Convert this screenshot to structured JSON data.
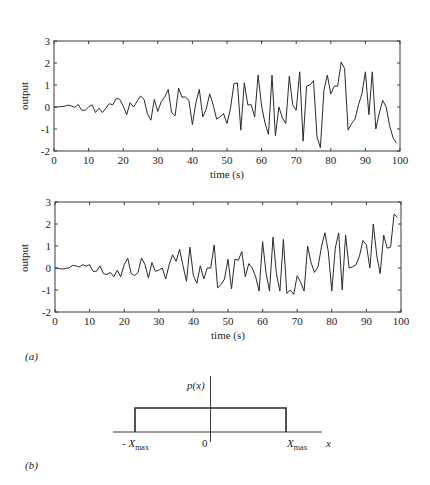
{
  "chart_data": [
    {
      "type": "line",
      "panel": "a-top",
      "title": "",
      "xlabel": "time (s)",
      "ylabel": "output",
      "xlim": [
        0,
        100
      ],
      "ylim": [
        -2,
        3
      ],
      "xticks": [
        0,
        10,
        20,
        30,
        40,
        50,
        60,
        70,
        80,
        90,
        100
      ],
      "yticks": [
        -2,
        -1,
        0,
        1,
        2,
        3
      ],
      "grid": false,
      "x": [
        0,
        1,
        2,
        3,
        4,
        5,
        6,
        7,
        8,
        9,
        10,
        11,
        12,
        13,
        14,
        15,
        16,
        17,
        18,
        19,
        20,
        21,
        22,
        23,
        24,
        25,
        26,
        27,
        28,
        29,
        30,
        31,
        32,
        33,
        34,
        35,
        36,
        37,
        38,
        39,
        40,
        41,
        42,
        43,
        44,
        45,
        46,
        47,
        48,
        49,
        50,
        51,
        52,
        53,
        54,
        55,
        56,
        57,
        58,
        59,
        60,
        61,
        62,
        63,
        64,
        65,
        66,
        67,
        68,
        69,
        70,
        71,
        72,
        73,
        74,
        75,
        76,
        77,
        78,
        79,
        80,
        81,
        82,
        83,
        84,
        85,
        86,
        87,
        88,
        89,
        90,
        91,
        92,
        93,
        94,
        95,
        96,
        97,
        98,
        99
      ],
      "values": [
        0.0,
        0.0,
        0.02,
        0.03,
        0.08,
        0.05,
        -0.02,
        0.12,
        -0.15,
        -0.15,
        0.0,
        0.1,
        -0.25,
        -0.05,
        -0.25,
        -0.05,
        0.15,
        0.1,
        0.4,
        0.35,
        0.05,
        -0.35,
        0.2,
        0.0,
        0.25,
        0.5,
        0.35,
        -0.3,
        -0.6,
        0.35,
        -0.2,
        0.25,
        0.45,
        0.8,
        -0.25,
        -0.4,
        0.85,
        0.45,
        0.45,
        0.3,
        -0.8,
        0.2,
        0.8,
        -0.45,
        -0.1,
        0.6,
        0.1,
        -0.55,
        -0.45,
        -0.3,
        -0.75,
        -0.05,
        1.05,
        1.1,
        -1.05,
        1.1,
        0.1,
        0.1,
        -0.45,
        1.45,
        0.05,
        -0.75,
        -1.25,
        1.45,
        -1.3,
        0.0,
        -0.5,
        -0.75,
        1.4,
        0.1,
        -0.15,
        1.6,
        -1.55,
        0.95,
        1.0,
        1.2,
        -1.35,
        -1.85,
        0.75,
        1.45,
        0.6,
        0.95,
        0.95,
        2.05,
        1.75,
        -1.05,
        -0.75,
        -0.55,
        0.1,
        0.6,
        1.6,
        -0.35,
        1.6,
        -1.0,
        -0.3,
        0.3,
        0.0,
        -0.85,
        -1.4,
        -1.65
      ]
    },
    {
      "type": "line",
      "panel": "a-bottom",
      "title": "",
      "xlabel": "time (s)",
      "ylabel": "output",
      "xlim": [
        0,
        100
      ],
      "ylim": [
        -2,
        3
      ],
      "xticks": [
        0,
        10,
        20,
        30,
        40,
        50,
        60,
        70,
        80,
        90,
        100
      ],
      "yticks": [
        -2,
        -1,
        0,
        1,
        2,
        3
      ],
      "grid": false,
      "x": [
        0,
        1,
        2,
        3,
        4,
        5,
        6,
        7,
        8,
        9,
        10,
        11,
        12,
        13,
        14,
        15,
        16,
        17,
        18,
        19,
        20,
        21,
        22,
        23,
        24,
        25,
        26,
        27,
        28,
        29,
        30,
        31,
        32,
        33,
        34,
        35,
        36,
        37,
        38,
        39,
        40,
        41,
        42,
        43,
        44,
        45,
        46,
        47,
        48,
        49,
        50,
        51,
        52,
        53,
        54,
        55,
        56,
        57,
        58,
        59,
        60,
        61,
        62,
        63,
        64,
        65,
        66,
        67,
        68,
        69,
        70,
        71,
        72,
        73,
        74,
        75,
        76,
        77,
        78,
        79,
        80,
        81,
        82,
        83,
        84,
        85,
        86,
        87,
        88,
        89,
        90,
        91,
        92,
        93,
        94,
        95,
        96,
        97,
        98,
        99
      ],
      "values": [
        0.0,
        -0.02,
        -0.05,
        -0.02,
        0.0,
        0.12,
        0.1,
        0.05,
        0.15,
        0.08,
        0.15,
        -0.15,
        -0.15,
        0.1,
        -0.25,
        -0.3,
        -0.2,
        -0.4,
        -0.1,
        -0.4,
        0.15,
        0.45,
        -0.25,
        -0.35,
        -0.2,
        0.45,
        0.15,
        -0.45,
        0.25,
        -0.15,
        -0.1,
        0.0,
        -0.5,
        0.15,
        0.6,
        0.3,
        0.85,
        0.1,
        -0.6,
        0.95,
        -0.35,
        -0.7,
        0.1,
        -0.5,
        0.0,
        0.0,
        1.05,
        -0.9,
        -0.75,
        -0.5,
        0.4,
        -0.95,
        0.4,
        0.35,
        0.75,
        -0.4,
        0.2,
        0.0,
        -0.4,
        -1.05,
        1.2,
        -0.25,
        -1.05,
        1.4,
        -0.25,
        -1.05,
        1.3,
        -1.15,
        -1.0,
        -1.2,
        -0.35,
        -0.65,
        -1.05,
        1.0,
        0.25,
        -0.2,
        0.05,
        0.95,
        1.6,
        0.75,
        -1.05,
        0.9,
        1.6,
        -1.0,
        1.5,
        0.0,
        0.05,
        0.15,
        0.55,
        1.25,
        1.05,
        0.0,
        2.0,
        0.55,
        -0.25,
        1.5,
        0.9,
        0.95,
        2.45,
        2.3,
        1.75
      ]
    },
    {
      "type": "diagram",
      "panel": "b",
      "title": "",
      "ylabel": "p(x)",
      "xlabel": "x",
      "shape": "uniform (rectangular) probability density",
      "x_labels": [
        "- X_max",
        "0",
        "X_max"
      ],
      "support": [
        "-X_max",
        "X_max"
      ]
    }
  ],
  "figure": {
    "panel_a_label": "(a)",
    "panel_b_label": "(b)",
    "top_plot": {
      "ylabel": "output",
      "xlabel": "time (s)",
      "xtick_labels": [
        "0",
        "10",
        "20",
        "30",
        "40",
        "50",
        "60",
        "70",
        "80",
        "90",
        "100"
      ],
      "ytick_labels": [
        "3",
        "2",
        "1",
        "0",
        "-1",
        "-2"
      ]
    },
    "bottom_plot": {
      "ylabel": "output",
      "xlabel": "time (s)",
      "xtick_labels": [
        "0",
        "10",
        "20",
        "30",
        "40",
        "50",
        "60",
        "70",
        "80",
        "90",
        "100"
      ],
      "ytick_labels": [
        "3",
        "2",
        "1",
        "0",
        "-1",
        "-2"
      ]
    },
    "pdf_plot": {
      "ylabel": "p(x)",
      "xlabel": "x",
      "neg_label_prefix": "- X",
      "label_sub": "max",
      "zero_label": "0",
      "pos_label": "X"
    }
  },
  "colors": {
    "line": "#2a2a2a",
    "axes": "#3a3a3a",
    "background": "#ffffff"
  }
}
